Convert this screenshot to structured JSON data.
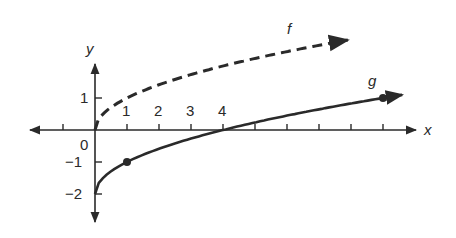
{
  "chart_data": {
    "type": "line",
    "title": "",
    "xlabel": "x",
    "ylabel": "y",
    "xlim": [
      -2,
      9.8
    ],
    "ylim": [
      -2.8,
      3.4
    ],
    "grid": false,
    "x_tick_labels": [
      "1",
      "2",
      "3",
      "4"
    ],
    "x_ticks": [
      -1,
      1,
      2,
      3,
      4,
      5,
      6,
      7,
      8,
      9
    ],
    "y_tick_labels": [
      "1",
      "0",
      "-1",
      "-2"
    ],
    "y_ticks": [
      1,
      -1,
      -2
    ],
    "origin_label": "0",
    "series": [
      {
        "name": "f",
        "formula": "f(x) = sqrt(x)",
        "style": "dashed",
        "x": [
          0,
          1,
          2,
          3,
          4,
          5,
          6,
          7,
          7.9
        ],
        "values": [
          0,
          1,
          1.41,
          1.73,
          2,
          2.24,
          2.45,
          2.65,
          2.81
        ],
        "label_position": [
          6.1,
          3.1
        ],
        "arrow_end": true,
        "marked_points": []
      },
      {
        "name": "g",
        "formula": "g(x) = sqrt(x) - 2",
        "style": "solid",
        "x": [
          0,
          1,
          2,
          3,
          4,
          5,
          6,
          7,
          8,
          9,
          9.6
        ],
        "values": [
          -2,
          -1,
          -0.59,
          -0.27,
          0,
          0.24,
          0.45,
          0.65,
          0.83,
          1,
          1.1
        ],
        "label_position": [
          8.6,
          1.35
        ],
        "arrow_end": true,
        "marked_points": [
          [
            1,
            -1
          ],
          [
            9,
            1
          ]
        ]
      }
    ]
  },
  "labels": {
    "x_axis": "x",
    "y_axis": "y",
    "f": "f",
    "g": "g",
    "origin": "0",
    "x1": "1",
    "x2": "2",
    "x3": "3",
    "x4": "4",
    "y1": "1",
    "ym1": "−1",
    "ym2": "−2"
  },
  "colors": {
    "ink": "#2a2a2a",
    "background": "#ffffff"
  }
}
